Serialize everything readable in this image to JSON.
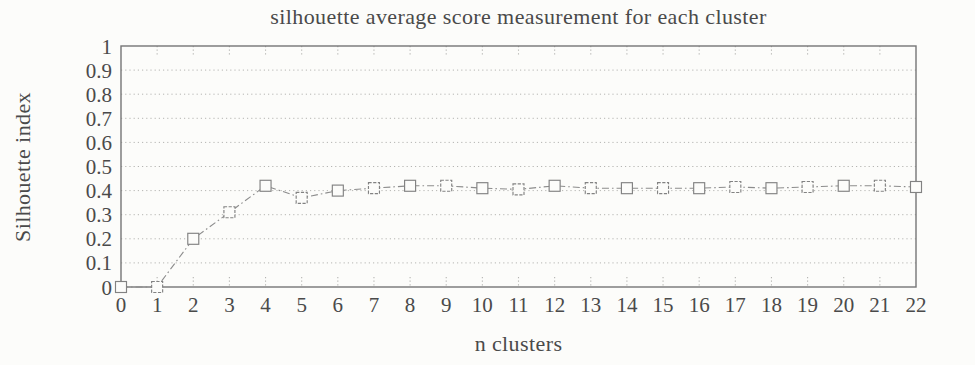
{
  "chart_data": {
    "type": "line",
    "title": "silhouette average score measurement for each cluster",
    "xlabel": "n clusters",
    "ylabel": "Silhouette index",
    "x": [
      0,
      1,
      2,
      3,
      4,
      5,
      6,
      7,
      8,
      9,
      10,
      11,
      12,
      13,
      14,
      15,
      16,
      17,
      18,
      19,
      20,
      21,
      22
    ],
    "values": [
      0,
      0,
      0.2,
      0.31,
      0.42,
      0.37,
      0.4,
      0.41,
      0.42,
      0.42,
      0.41,
      0.405,
      0.42,
      0.41,
      0.41,
      0.41,
      0.41,
      0.415,
      0.41,
      0.415,
      0.42,
      0.42,
      0.415
    ],
    "x_tick_labels": [
      "0",
      "1",
      "2",
      "3",
      "4",
      "5",
      "6",
      "7",
      "8",
      "9",
      "10",
      "11",
      "12",
      "13",
      "14",
      "15",
      "16",
      "17",
      "18",
      "19",
      "20",
      "21",
      "22"
    ],
    "y_ticks": [
      0,
      0.1,
      0.2,
      0.3,
      0.4,
      0.5,
      0.6,
      0.7,
      0.8,
      0.9,
      1
    ],
    "y_tick_labels": [
      "0",
      "0.1",
      "0.2",
      "0.3",
      "0.4",
      "0.5",
      "0.6",
      "0.7",
      "0.8",
      "0.9",
      "1"
    ],
    "xlim": [
      0,
      22
    ],
    "ylim": [
      0,
      1
    ],
    "grid": "dotted horizontal gridlines at each 0.1; dotted inward tick stubs at each integer x",
    "legend_position": "none",
    "marker": "open-square",
    "line_style": "dash-dot",
    "colors": {
      "background": "#fcfcfa",
      "text": "#4a4a4a",
      "axis": "#757575",
      "grid": "#b5b5b2",
      "line": "#8c8c8c",
      "marker": "#828282"
    }
  }
}
